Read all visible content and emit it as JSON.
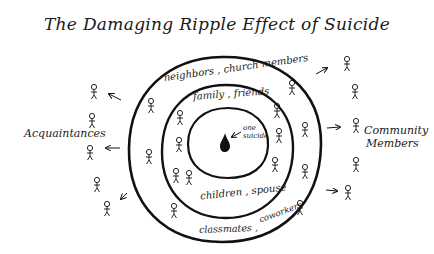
{
  "title": "The Damaging Ripple Effect of Suicide",
  "center": {
    "label": "one suicide",
    "label_line1": "one",
    "label_line2": "suicide",
    "icon": "drop-icon"
  },
  "rings": [
    {
      "name": "inner",
      "labels": []
    },
    {
      "name": "middle",
      "labels": [
        "family , friends",
        "children , spouse"
      ]
    },
    {
      "name": "outer",
      "labels": [
        "neighbors , church members",
        "classmates , coworkers"
      ]
    }
  ],
  "ring_labels": {
    "top_middle": "family , friends",
    "bottom_middle": "children , spouse",
    "top_outer": "neighbors , church members",
    "bottom_outer_left": "classmates ,",
    "bottom_outer_right": "coworkers"
  },
  "outside_groups": {
    "left": {
      "label": "Acquaintances",
      "figure_count": 5
    },
    "right": {
      "label_line1": "Community",
      "label_line2": "Members",
      "figure_count": 5
    }
  },
  "figures": {
    "middle_ring_count": 7,
    "outer_ring_count": 7
  },
  "colors": {
    "ink": "#111111",
    "background": "#ffffff"
  }
}
